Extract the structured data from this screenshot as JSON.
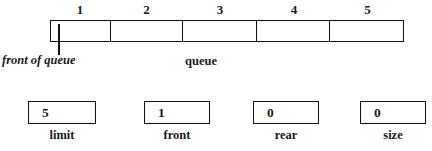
{
  "diagram": {
    "line_color": "#111111",
    "background_color": "#ffffff"
  },
  "queue": {
    "label": "queue",
    "front_pointer_label": "front of queue",
    "index_labels": [
      "1",
      "2",
      "3",
      "4",
      "5"
    ],
    "cells": [
      {
        "index": "1",
        "value": ""
      },
      {
        "index": "2",
        "value": ""
      },
      {
        "index": "3",
        "value": ""
      },
      {
        "index": "4",
        "value": ""
      },
      {
        "index": "5",
        "value": ""
      }
    ]
  },
  "variables": [
    {
      "name": "limit",
      "value": "5",
      "label": "limit"
    },
    {
      "name": "front",
      "value": "1",
      "label": "front"
    },
    {
      "name": "rear",
      "value": "0",
      "label": "rear"
    },
    {
      "name": "size",
      "value": "0",
      "label": "size"
    }
  ]
}
